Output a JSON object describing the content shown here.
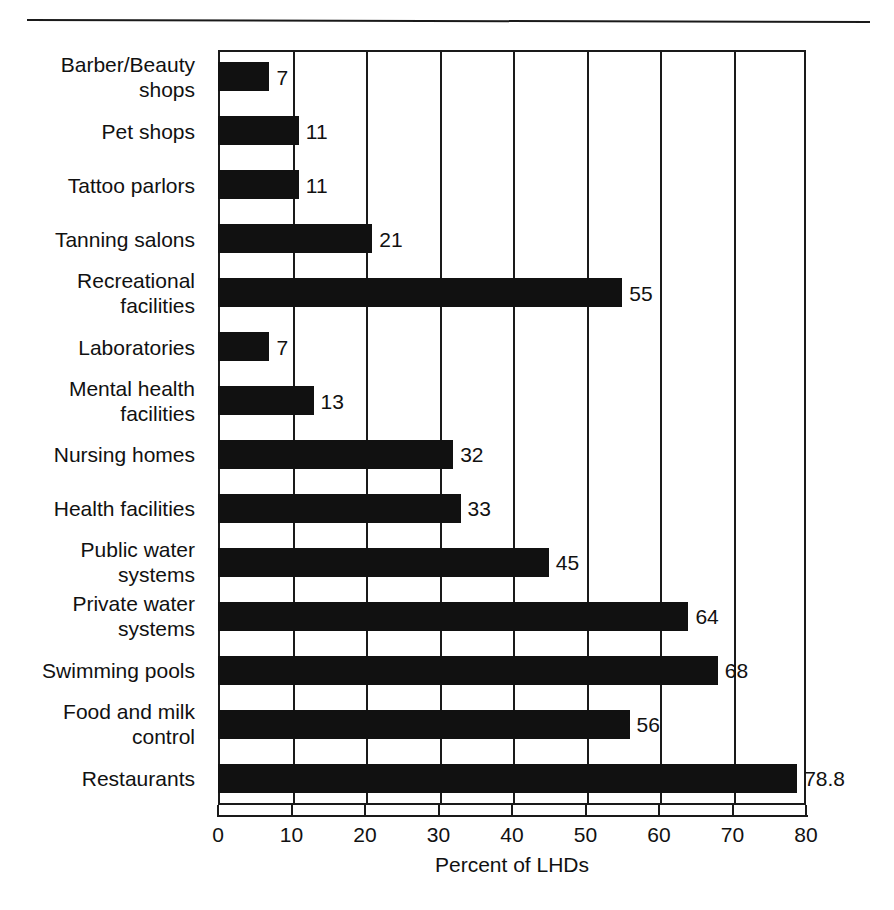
{
  "chart_data": {
    "type": "bar",
    "orientation": "horizontal",
    "title": "",
    "subtitle": "",
    "xlabel": "Percent of LHDs",
    "ylabel": "",
    "xlim": [
      0,
      80
    ],
    "xticks": [
      0,
      10,
      20,
      30,
      40,
      50,
      60,
      70,
      80
    ],
    "xtick_labels": [
      "0",
      "10",
      "20",
      "30",
      "40",
      "50",
      "60",
      "70",
      "80"
    ],
    "grid": "vertical",
    "legend": null,
    "bar_color": "#111111",
    "frame_color": "#1a1a1a",
    "categories": [
      "Barber/Beauty shops",
      "Pet shops",
      "Tattoo parlors",
      "Tanning salons",
      "Recreational facilities",
      "Laboratories",
      "Mental health facilities",
      "Nursing homes",
      "Health facilities",
      "Public water systems",
      "Private water systems",
      "Swimming pools",
      "Food and milk control",
      "Restaurants"
    ],
    "category_lines": [
      [
        "Barber/Beauty",
        "shops"
      ],
      [
        "Pet shops"
      ],
      [
        "Tattoo parlors"
      ],
      [
        "Tanning salons"
      ],
      [
        "Recreational",
        "facilities"
      ],
      [
        "Laboratories"
      ],
      [
        "Mental health",
        "facilities"
      ],
      [
        "Nursing homes"
      ],
      [
        "Health facilities"
      ],
      [
        "Public water",
        "systems"
      ],
      [
        "Private water",
        "systems"
      ],
      [
        "Swimming pools"
      ],
      [
        "Food and milk",
        "control"
      ],
      [
        "Restaurants"
      ]
    ],
    "values": [
      7,
      11,
      11,
      21,
      55,
      7,
      13,
      32,
      33,
      45,
      64,
      68,
      56,
      78.8
    ],
    "value_labels": [
      "7",
      "11",
      "11",
      "21",
      "55",
      "7",
      "13",
      "32",
      "33",
      "45",
      "64",
      "68",
      "56",
      "78.8"
    ]
  }
}
